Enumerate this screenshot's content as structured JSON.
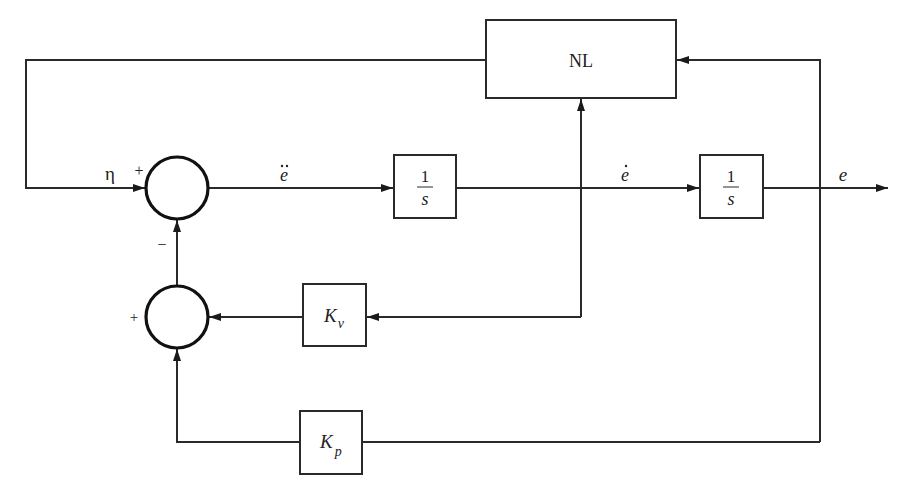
{
  "diagram": {
    "type": "control-block-diagram",
    "blocks": {
      "nl": {
        "label": "NL"
      },
      "integrator1": {
        "numerator": "1",
        "denominator": "s"
      },
      "integrator2": {
        "numerator": "1",
        "denominator": "s"
      },
      "kv": {
        "base": "K",
        "subscript": "v"
      },
      "kp": {
        "base": "K",
        "subscript": "p"
      }
    },
    "signals": {
      "eta": "η",
      "e_ddot": "e",
      "e_dot": "e",
      "e": "e"
    },
    "signs": {
      "sum1_left": "+",
      "sum1_bottom": "−",
      "sum2_left": "+"
    },
    "colors": {
      "line": "#2a2a2a",
      "background": "#ffffff"
    }
  }
}
